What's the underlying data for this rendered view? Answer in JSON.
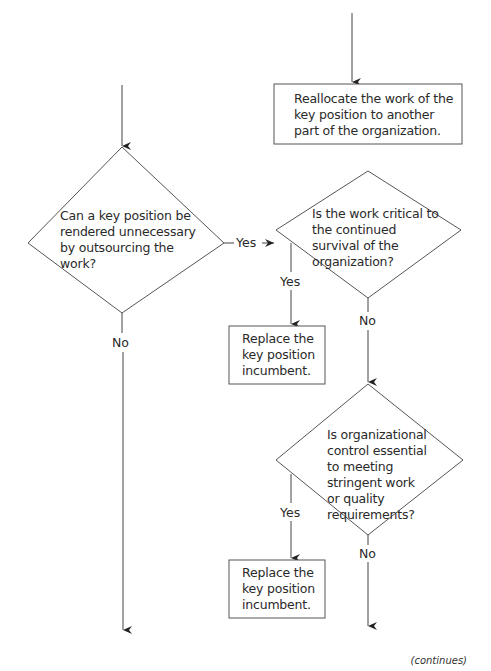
{
  "diagram": {
    "type": "flowchart",
    "nodes": {
      "reallocate_box": {
        "kind": "process",
        "text": "Reallocate the work of the key position to another part of the organization."
      },
      "decision_outsourcing": {
        "kind": "decision",
        "text": "Can a key position be rendered unnecessary by outsourcing the work?"
      },
      "decision_critical": {
        "kind": "decision",
        "text": "Is the work critical to the continued survival of the organization?"
      },
      "replace_box_1": {
        "kind": "process",
        "text": "Replace the key position incumbent."
      },
      "decision_control": {
        "kind": "decision",
        "text": "Is organizational control essential to meeting stringent work or quality requirements?"
      },
      "replace_box_2": {
        "kind": "process",
        "text": "Replace the key position incumbent."
      }
    },
    "edge_labels": {
      "outsourcing_yes": "Yes",
      "outsourcing_no": "No",
      "critical_yes": "Yes",
      "critical_no": "No",
      "control_yes": "Yes",
      "control_no": "No"
    },
    "edges": [
      {
        "from": "decision_outsourcing",
        "to": "decision_critical",
        "label": "Yes"
      },
      {
        "from": "decision_outsourcing",
        "to": "continues",
        "label": "No"
      },
      {
        "from": "decision_critical",
        "to": "replace_box_1",
        "label": "Yes"
      },
      {
        "from": "decision_critical",
        "to": "decision_control",
        "label": "No"
      },
      {
        "from": "decision_control",
        "to": "replace_box_2",
        "label": "Yes"
      },
      {
        "from": "decision_control",
        "to": "continues",
        "label": "No"
      }
    ],
    "footer": "(continues)"
  }
}
